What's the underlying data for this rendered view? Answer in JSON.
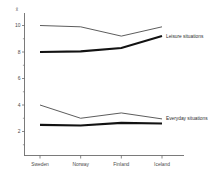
{
  "chart_data": {
    "type": "line",
    "title": "",
    "subtitle": "",
    "xlabel": "",
    "ylabel": "x̄",
    "categories": [
      "Sweden",
      "Norway",
      "Finland",
      "Iceland"
    ],
    "ylim": [
      0,
      11
    ],
    "yticks": [
      2,
      4,
      6,
      8,
      10
    ],
    "ytick_labels": [
      "2",
      "4",
      "6",
      "8",
      "10"
    ],
    "grid": false,
    "legend_position": "inline-right",
    "series": [
      {
        "name": "Leisure situations upper",
        "style": "thin",
        "group": "Leisure situations",
        "values": [
          10.0,
          9.9,
          9.2,
          9.9
        ]
      },
      {
        "name": "Leisure situations lower",
        "style": "thick",
        "group": "Leisure situations",
        "values": [
          8.0,
          8.05,
          8.3,
          9.2
        ]
      },
      {
        "name": "Everyday situations upper",
        "style": "thin",
        "group": "Everyday situations",
        "values": [
          4.0,
          3.0,
          3.4,
          2.95
        ]
      },
      {
        "name": "Everyday situations lower",
        "style": "thick",
        "group": "Everyday situations",
        "values": [
          2.5,
          2.45,
          2.65,
          2.6
        ]
      }
    ],
    "annotations": [
      {
        "text": "Leisure situations",
        "at_x": 3,
        "at_y": 9.2
      },
      {
        "text": "Everyday situations",
        "at_x": 3,
        "at_y": 3.0
      }
    ],
    "colors": {
      "thin_line": "#4a4a4a",
      "thick_line": "#121212",
      "axis": "#6b6b6b",
      "text": "#4a4a4a",
      "background": "#ffffff"
    }
  }
}
